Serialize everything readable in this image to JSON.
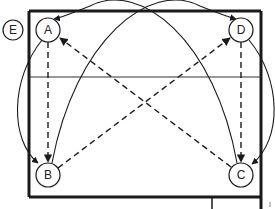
{
  "diagram": {
    "type": "drill-diagram",
    "colors": {
      "stroke": "#1a1a1a",
      "background": "#ffffff"
    },
    "field": {
      "left": 29,
      "top": 11,
      "right": 261,
      "bottom": 197,
      "midline_y": 77
    },
    "nodes": [
      {
        "id": "E",
        "label": "E",
        "x": 13,
        "y": 30,
        "r": 10
      },
      {
        "id": "A",
        "label": "A",
        "x": 48,
        "y": 30,
        "r": 12
      },
      {
        "id": "D",
        "label": "D",
        "x": 241,
        "y": 30,
        "r": 12
      },
      {
        "id": "B",
        "label": "B",
        "x": 48,
        "y": 175,
        "r": 12
      },
      {
        "id": "C",
        "label": "C",
        "x": 241,
        "y": 175,
        "r": 12
      }
    ],
    "edges": [
      {
        "from": "A",
        "to": "B",
        "style": "dashed",
        "shape": "straight"
      },
      {
        "from": "D",
        "to": "C",
        "style": "dashed",
        "shape": "straight"
      },
      {
        "from": "B",
        "to": "D",
        "style": "dashed",
        "shape": "straight"
      },
      {
        "from": "C",
        "to": "A",
        "style": "dashed",
        "shape": "straight"
      },
      {
        "from": "A",
        "to": "B",
        "style": "solid",
        "shape": "curve-left"
      },
      {
        "from": "D",
        "to": "C",
        "style": "solid",
        "shape": "curve-right"
      },
      {
        "from": "B",
        "to": "D",
        "style": "solid",
        "shape": "arc-over-top"
      },
      {
        "from": "C",
        "to": "A",
        "style": "solid",
        "shape": "arc-over-top"
      }
    ]
  }
}
